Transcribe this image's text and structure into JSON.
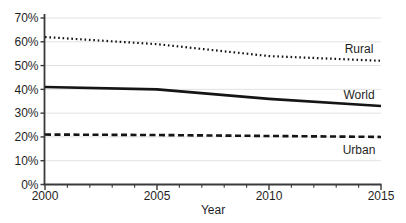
{
  "figure": {
    "background": "#ffffff",
    "axis_color": "#3a3a3a",
    "grid_color": "#e2e2e2",
    "line_color": "#151515",
    "text_color": "#1f1f1f"
  },
  "chart_data": {
    "type": "line",
    "title": "",
    "xlabel": "Year",
    "ylabel": "",
    "x": [
      2000,
      2005,
      2010,
      2015
    ],
    "xlim": [
      2000,
      2015
    ],
    "ylim": [
      0,
      70
    ],
    "grid": "horizontal-gridlines-every-10pct",
    "legend_position": "inline-labels-at-right-end-of-lines",
    "xticks": {
      "major": [
        2000,
        2005,
        2010,
        2015
      ],
      "labels": [
        "2000",
        "2005",
        "2010",
        "2015"
      ],
      "minor_interval": 1
    },
    "yticks": {
      "values": [
        0,
        10,
        20,
        30,
        40,
        50,
        60,
        70
      ],
      "labels": [
        "0%",
        "10%",
        "20%",
        "30%",
        "40%",
        "50%",
        "60%",
        "70%"
      ]
    },
    "series": [
      {
        "name": "Rural",
        "line_style": "dotted",
        "label_side": "above",
        "values": [
          62,
          59,
          54,
          52
        ]
      },
      {
        "name": "World",
        "line_style": "solid",
        "label_side": "above",
        "values": [
          41,
          40,
          36,
          33
        ]
      },
      {
        "name": "Urban",
        "line_style": "dashed",
        "label_side": "below",
        "values": [
          21,
          20.8,
          20.4,
          20
        ]
      }
    ]
  }
}
